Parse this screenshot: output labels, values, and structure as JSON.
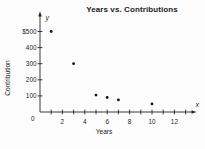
{
  "figure": {
    "background": "#fdfdfd"
  },
  "chart_data": {
    "type": "scatter",
    "title": "Years vs. Contributions",
    "xlabel": "Years",
    "ylabel": "Contribution",
    "x_axis_symbol": "x",
    "y_axis_symbol": "y",
    "origin_label": "0",
    "grid": false,
    "legend": false,
    "point_color": "#141414",
    "axis_color": "#242424",
    "text_color": "#1b1b1b",
    "xlim": [
      0,
      13.5
    ],
    "ylim": [
      0,
      590
    ],
    "x_axis": {
      "minor_ticks": [
        1,
        2,
        3,
        4,
        5,
        6,
        7,
        8,
        9,
        10,
        11,
        12,
        13
      ],
      "tick_values": [
        2,
        4,
        6,
        8,
        10,
        12
      ],
      "tick_labels": [
        "2",
        "4",
        "6",
        "8",
        "10",
        "12"
      ]
    },
    "y_axis": {
      "tick_values": [
        100,
        200,
        300,
        400,
        500
      ],
      "tick_labels": [
        "100",
        "200",
        "300",
        "400",
        "$500"
      ]
    },
    "points": [
      {
        "x": 1,
        "y": 500
      },
      {
        "x": 3,
        "y": 300
      },
      {
        "x": 5,
        "y": 105
      },
      {
        "x": 6,
        "y": 90
      },
      {
        "x": 7,
        "y": 75
      },
      {
        "x": 10,
        "y": 50
      }
    ]
  }
}
